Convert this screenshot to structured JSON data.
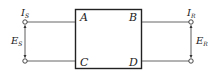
{
  "diagram": {
    "box": {
      "corners": {
        "top_left": "A",
        "top_right": "B",
        "bottom_left": "C",
        "bottom_right": "D"
      }
    },
    "sending_end": {
      "current": {
        "main": "I",
        "sub": "S"
      },
      "voltage": {
        "main": "E",
        "sub": "S"
      }
    },
    "receiving_end": {
      "current": {
        "main": "I",
        "sub": "R"
      },
      "voltage": {
        "main": "E",
        "sub": "R"
      }
    },
    "colors": {
      "stroke": "#333333",
      "wire": "#555555",
      "background": "#ffffff"
    }
  }
}
